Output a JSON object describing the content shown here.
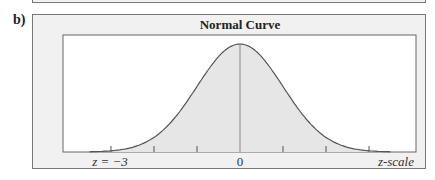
{
  "part_label": "b)",
  "chart_data": {
    "type": "area",
    "title": "Normal Curve",
    "xlabel": "z-scale",
    "ylabel": "",
    "x_range": [
      -3.5,
      3.5
    ],
    "shaded_range": [
      -3,
      3.5
    ],
    "ticks": [
      -3,
      -2,
      -1,
      0,
      1,
      2,
      3
    ],
    "tick_labels": [
      {
        "z": -3,
        "label": "z = −3"
      },
      {
        "z": 0,
        "label": "0"
      }
    ],
    "mean": 0,
    "sd": 1,
    "grid": false,
    "legend": null
  },
  "labels": {
    "title": "Normal Curve",
    "z_minus3": "z = −3",
    "zero": "0",
    "axis": "z-scale"
  },
  "colors": {
    "frame_bg": "#f1f1f1",
    "plot_bg": "#ffffff",
    "shade": "#e6e6e6",
    "line": "#555555"
  }
}
